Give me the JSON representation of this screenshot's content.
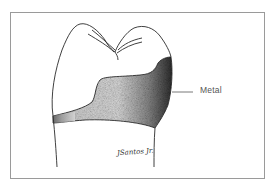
{
  "figure": {
    "annotation": {
      "label": "Metal"
    },
    "signature": "JSantos Jr.",
    "colors": {
      "border": "#9a9a9a",
      "line": "#2a2a2a",
      "shade_light": "#d8d8d8",
      "shade_dark": "#3a3a3a",
      "label": "#555555"
    }
  }
}
